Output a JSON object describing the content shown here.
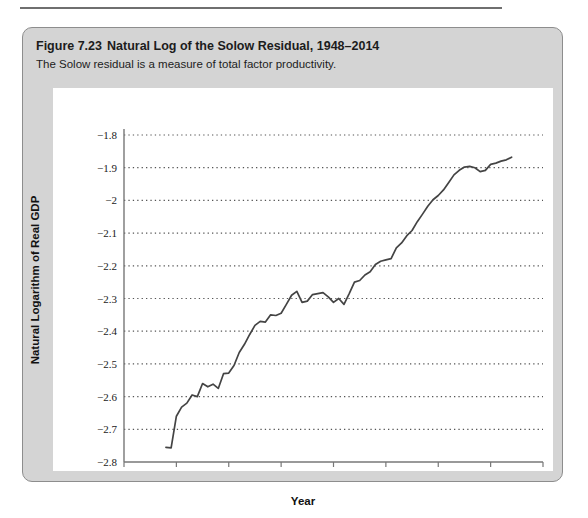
{
  "figure": {
    "number": "Figure 7.23",
    "title": "Natural Log of the Solow Residual, 1948–2014",
    "subtitle": "The Solow residual is a measure of total factor productivity."
  },
  "colors": {
    "card_background": "#d4d4d4",
    "card_border": "#8d8d8d",
    "panel_background": "#ffffff",
    "line": "#444444",
    "gridline": "#555555",
    "axis": "#777777",
    "text": "#1c1c1c"
  },
  "chart_data": {
    "type": "line",
    "title": "Natural Log of the Solow Residual, 1948–2014",
    "subtitle": "The Solow residual is a measure of total factor productivity.",
    "xlabel": "Year",
    "ylabel": "Natural Logarithm of Real GDP",
    "xlim": [
      1940,
      2020
    ],
    "ylim": [
      -2.8,
      -1.8
    ],
    "xticks": [
      1940,
      1950,
      1960,
      1970,
      1980,
      1990,
      2000,
      2010,
      2020
    ],
    "xticklabels": [
      "1940",
      "1950",
      "1960",
      "1970",
      "1980",
      "1990",
      "2000",
      "2010",
      "2020"
    ],
    "yticks": [
      -2.8,
      -2.7,
      -2.6,
      -2.5,
      -2.4,
      -2.3,
      -2.2,
      -2.1,
      -2.0,
      -1.9,
      -1.8
    ],
    "yticklabels": [
      "−2.8",
      "−2.7",
      "−2.6",
      "−2.5",
      "−2.4",
      "−2.3",
      "−2.2",
      "−2.1",
      "−2",
      "−1.9",
      "−1.8"
    ],
    "grid": "horizontal-dotted",
    "legend": "none",
    "series": [
      {
        "name": "Natural log of the Solow residual",
        "x": [
          1948,
          1949,
          1950,
          1951,
          1952,
          1953,
          1954,
          1955,
          1956,
          1957,
          1958,
          1959,
          1960,
          1961,
          1962,
          1963,
          1964,
          1965,
          1966,
          1967,
          1968,
          1969,
          1970,
          1971,
          1972,
          1973,
          1974,
          1975,
          1976,
          1977,
          1978,
          1979,
          1980,
          1981,
          1982,
          1983,
          1984,
          1985,
          1986,
          1987,
          1988,
          1989,
          1990,
          1991,
          1992,
          1993,
          1994,
          1995,
          1996,
          1997,
          1998,
          1999,
          2000,
          2001,
          2002,
          2003,
          2004,
          2005,
          2006,
          2007,
          2008,
          2009,
          2010,
          2011,
          2012,
          2013,
          2014
        ],
        "values": [
          -2.755,
          -2.757,
          -2.66,
          -2.632,
          -2.62,
          -2.595,
          -2.6,
          -2.56,
          -2.57,
          -2.562,
          -2.575,
          -2.53,
          -2.528,
          -2.505,
          -2.465,
          -2.44,
          -2.41,
          -2.382,
          -2.37,
          -2.372,
          -2.35,
          -2.352,
          -2.345,
          -2.318,
          -2.29,
          -2.278,
          -2.312,
          -2.308,
          -2.288,
          -2.285,
          -2.282,
          -2.295,
          -2.312,
          -2.3,
          -2.318,
          -2.285,
          -2.25,
          -2.245,
          -2.228,
          -2.218,
          -2.196,
          -2.186,
          -2.182,
          -2.178,
          -2.145,
          -2.13,
          -2.108,
          -2.092,
          -2.065,
          -2.042,
          -2.018,
          -1.998,
          -1.985,
          -1.968,
          -1.945,
          -1.922,
          -1.908,
          -1.898,
          -1.896,
          -1.9,
          -1.912,
          -1.908,
          -1.89,
          -1.886,
          -1.88,
          -1.876,
          -1.868
        ]
      }
    ]
  }
}
